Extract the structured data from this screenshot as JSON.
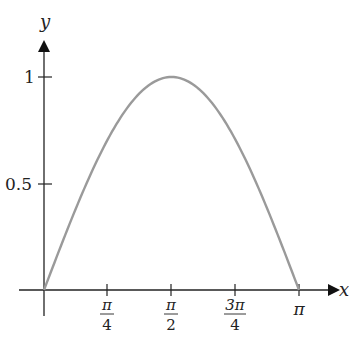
{
  "chart_data": {
    "type": "line",
    "title": "",
    "function": "y = sin(x)",
    "xlabel": "x",
    "ylabel": "y",
    "xlim": [
      0,
      3.14159
    ],
    "ylim": [
      0,
      1
    ],
    "grid": false,
    "x_ticks": [
      {
        "value": 0.7854,
        "num": "π",
        "den": "4"
      },
      {
        "value": 1.5708,
        "num": "π",
        "den": "2"
      },
      {
        "value": 2.3562,
        "num": "3π",
        "den": "4"
      },
      {
        "value": 3.1416,
        "num": "π",
        "den": ""
      }
    ],
    "y_ticks": [
      {
        "value": 0.5,
        "label": "0.5"
      },
      {
        "value": 1,
        "label": "1"
      }
    ],
    "series": [
      {
        "name": "sin(x)",
        "color": "#9a9a9a",
        "x": [
          0,
          0.3927,
          0.7854,
          1.1781,
          1.5708,
          1.9635,
          2.3562,
          2.7489,
          3.1416
        ],
        "y": [
          0,
          0.3827,
          0.7071,
          0.9239,
          1,
          0.9239,
          0.7071,
          0.3827,
          0
        ]
      }
    ]
  },
  "labels": {
    "x_axis": "x",
    "y_axis": "y",
    "y_tick_1": "1",
    "y_tick_05": "0.5",
    "xt1_num": "π",
    "xt1_den": "4",
    "xt2_num": "π",
    "xt2_den": "2",
    "xt3_num": "3π",
    "xt3_den": "4",
    "xt4": "π"
  }
}
